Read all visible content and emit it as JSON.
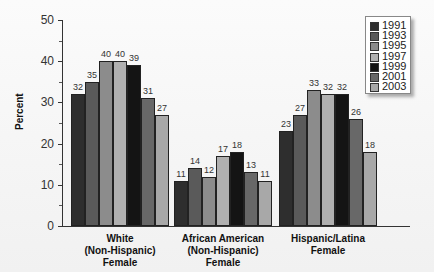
{
  "chart_data": {
    "type": "bar",
    "title": "",
    "xlabel": "",
    "ylabel": "Percent",
    "ylim": [
      0,
      50
    ],
    "yticks": [
      0,
      10,
      20,
      30,
      40,
      50
    ],
    "categories": [
      "White (Non-Hispanic) Female",
      "African American (Non-Hispanic) Female",
      "Hispanic/Latina Female"
    ],
    "category_lines": [
      [
        "White",
        "(Non-Hispanic)",
        "Female"
      ],
      [
        "African American",
        "(Non-Hispanic)",
        "Female"
      ],
      [
        "Hispanic/Latina",
        "Female"
      ]
    ],
    "series": [
      {
        "name": "1991",
        "color": "#2e2e2e",
        "values": [
          32,
          11,
          23
        ]
      },
      {
        "name": "1993",
        "color": "#5a5a5a",
        "values": [
          35,
          14,
          27
        ]
      },
      {
        "name": "1995",
        "color": "#8c8c8c",
        "values": [
          40,
          12,
          33
        ]
      },
      {
        "name": "1997",
        "color": "#b0b0b0",
        "values": [
          40,
          17,
          32
        ]
      },
      {
        "name": "1999",
        "color": "#141414",
        "values": [
          39,
          18,
          32
        ]
      },
      {
        "name": "2001",
        "color": "#686868",
        "values": [
          31,
          13,
          26
        ]
      },
      {
        "name": "2003",
        "color": "#a8a8a8",
        "values": [
          27,
          11,
          18
        ]
      }
    ],
    "legend_position": "top-right",
    "grid": false,
    "data_labels": true
  }
}
